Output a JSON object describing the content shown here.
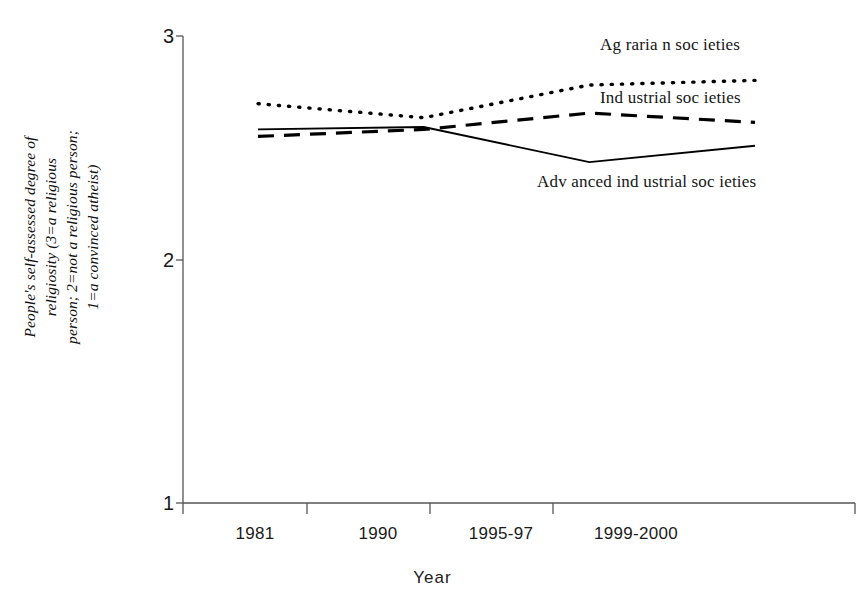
{
  "chart_data": {
    "type": "line",
    "title": "",
    "xlabel": "Year",
    "ylabel": "People's self-assessed degree of religiosity (3=a religious person; 2=not a religious person; 1=a convinced atheist)",
    "categories": [
      "1981",
      "1990",
      "1995-97",
      "1999-2000"
    ],
    "ylim": [
      1,
      3
    ],
    "yticks": [
      "1",
      "2",
      "3"
    ],
    "grid": false,
    "legend_position": "inline-annotations",
    "series": [
      {
        "name": "Agrarian societies",
        "style": "dotted",
        "values": [
          2.71,
          2.65,
          2.79,
          2.81
        ]
      },
      {
        "name": "Industrial societies",
        "style": "dashed",
        "values": [
          2.57,
          2.6,
          2.67,
          2.63
        ]
      },
      {
        "name": "Advanced industrial societies",
        "style": "solid",
        "values": [
          2.6,
          2.61,
          2.46,
          2.53
        ]
      }
    ]
  },
  "axes": {
    "y_title_line1": "People's self-assessed degree of",
    "y_title_line2": "religiosity (3=a religious",
    "y_title_line3": "person; 2=not a religious person;",
    "y_title_line4": "1=a convinced atheist)",
    "x_title": "Year",
    "y_tick_top": "3",
    "y_tick_mid": "2",
    "y_tick_bottom": "1",
    "x_tick_1": "1981",
    "x_tick_2": "1990",
    "x_tick_3": "1995-97",
    "x_tick_4": "1999-2000"
  },
  "annotations": {
    "agrarian_label": "Ag raria n soc ieties",
    "industrial_label": "Ind ustrial  soc ieties",
    "advanced_label": "Adv anced ind ustrial  soc ieties"
  },
  "colors": {
    "line": "#000000",
    "axis": "#555555",
    "text": "#1a1a1a",
    "background": "#ffffff"
  }
}
